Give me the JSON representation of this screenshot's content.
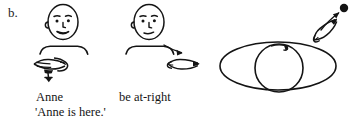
{
  "figure": {
    "label": "b.",
    "caption_lines": {
      "gloss_1": "Anne",
      "gloss_2": "be at-right",
      "translation": "'Anne is here.'"
    }
  },
  "panels": [
    {
      "name": "signer-anne",
      "gloss": "Anne",
      "icon": "signer-head-and-shoulders",
      "gesture": "flat-hand-pointing-left",
      "gesture_position": "below-chest-left"
    },
    {
      "name": "signer-be-at-right",
      "gloss": "be at-right",
      "icon": "signer-head-and-shoulders",
      "gesture": "index-finger-pointing-right",
      "gesture_position": "lower-right-of-chest"
    },
    {
      "name": "eye-diagram",
      "gloss": "",
      "icon": "eye-with-iris",
      "gesture": "index-finger-pointing-up-right-at-dot",
      "gesture_position": "upper-right"
    }
  ],
  "colors": {
    "ink": "#141414",
    "background": "#ffffff"
  }
}
